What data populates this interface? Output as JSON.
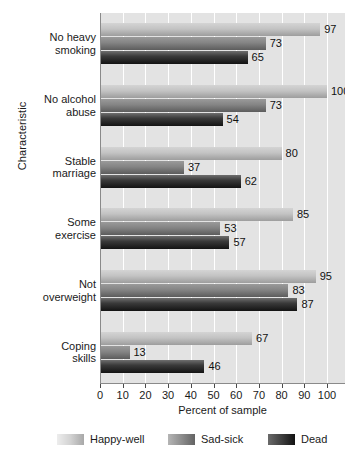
{
  "chart_data": {
    "type": "bar",
    "orientation": "horizontal",
    "title": "",
    "xlabel": "Percent of sample",
    "ylabel": "Characteristic",
    "xlim": [
      0,
      100
    ],
    "xticks": [
      0,
      10,
      20,
      30,
      40,
      50,
      60,
      70,
      80,
      90,
      100
    ],
    "grid": true,
    "legend_position": "bottom",
    "categories": [
      "No heavy\nsmoking",
      "No alcohol\nabuse",
      "Stable\nmarriage",
      "Some\nexercise",
      "Not\noverweight",
      "Coping\nskills"
    ],
    "category_lines": [
      [
        "No heavy",
        "smoking"
      ],
      [
        "No alcohol",
        "abuse"
      ],
      [
        "Stable",
        "marriage"
      ],
      [
        "Some",
        "exercise"
      ],
      [
        "Not",
        "overweight"
      ],
      [
        "Coping",
        "skills"
      ]
    ],
    "series": [
      {
        "name": "Happy-well",
        "color": "#c3c3c3",
        "values": [
          97,
          100,
          80,
          85,
          95,
          67
        ]
      },
      {
        "name": "Sad-sick",
        "color": "#848484",
        "values": [
          73,
          73,
          37,
          53,
          83,
          13
        ]
      },
      {
        "name": "Dead",
        "color": "#2a2a2a",
        "values": [
          65,
          54,
          62,
          57,
          87,
          46
        ]
      }
    ]
  },
  "legend": {
    "items": [
      {
        "label": "Happy-well"
      },
      {
        "label": "Sad-sick"
      },
      {
        "label": "Dead"
      }
    ]
  },
  "axes": {
    "x_title": "Percent of sample",
    "y_title": "Characteristic"
  }
}
